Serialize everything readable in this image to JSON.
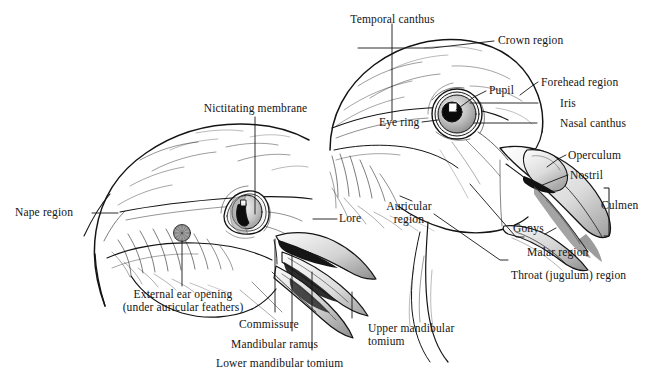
{
  "figure": {
    "background_color": "#ffffff",
    "ink_color": "#141414",
    "subject_left": "bird head with open bill, auricular region exposed",
    "subject_right": "bird head with closed bill, eye detail"
  },
  "labels": {
    "nictitating_membrane": "Nictitating membrane",
    "nape_region": "Nape region",
    "external_ear_opening_line1": "External ear opening",
    "external_ear_opening_line2": "(under auricular feathers)",
    "commissure": "Commissure",
    "mandibular_ramus": "Mandibular ramus",
    "lower_mandibular_tomium": "Lower mandibular tomium",
    "upper_mandibular_tomium_line1": "Upper mandibular",
    "upper_mandibular_tomium_line2": "tomium",
    "lore": "Lore",
    "temporal_canthus": "Temporal canthus",
    "crown_region": "Crown region",
    "forehead_region": "Forehead region",
    "pupil": "Pupil",
    "iris": "Iris",
    "eye_ring": "Eye ring",
    "nasal_canthus": "Nasal canthus",
    "operculum": "Operculum",
    "nostril": "Nostril",
    "culmen": "Culmen",
    "gonys": "Gonys",
    "malar_region": "Malar region",
    "throat_jugulum_region": "Throat (jugulum) region",
    "auricular_region_line1": "Auricular",
    "auricular_region_line2": "region"
  }
}
